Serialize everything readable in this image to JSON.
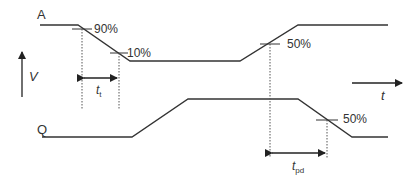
{
  "diagram": {
    "signals": [
      {
        "name": "A",
        "label": "A",
        "points": [
          [
            40,
            25
          ],
          [
            78,
            25
          ],
          [
            130,
            61
          ],
          [
            240,
            61
          ],
          [
            298,
            25
          ],
          [
            388,
            25
          ]
        ]
      },
      {
        "name": "Q",
        "label": "Q",
        "points": [
          [
            42,
            137
          ],
          [
            132,
            137
          ],
          [
            188,
            99
          ],
          [
            298,
            99
          ],
          [
            352,
            137
          ],
          [
            388,
            137
          ]
        ]
      }
    ],
    "annotations": {
      "a_90": "90%",
      "a_10": "10%",
      "a_50": "50%",
      "q_50": "50%",
      "tt_main": "t",
      "tt_sub": "t",
      "tpd_main": "t",
      "tpd_sub": "pd"
    },
    "axes": {
      "v_label": "V",
      "t_label": "t"
    },
    "colors": {
      "line": "#333333",
      "dotted": "#555555"
    }
  }
}
